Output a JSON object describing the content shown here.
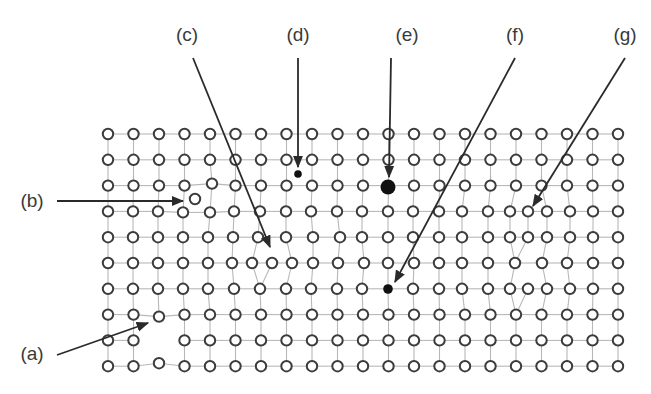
{
  "figure": {
    "colors": {
      "atom_stroke": "#3c3c3c",
      "bond": "#b8b8b8",
      "arrow": "#2a2a2a",
      "dark_atom": "#111111",
      "label": "#3a3a3a"
    }
  },
  "lattice": {
    "cols": 21,
    "rows": 10,
    "x0": 108,
    "dx": 25.5,
    "y0": 134,
    "dy": 25.8,
    "atom_radius": 5.2,
    "overrides": [
      {
        "r": 2,
        "c": 3,
        "dx": 0,
        "dy": 0
      },
      {
        "r": 2,
        "c": 4,
        "dx": 2,
        "dy": -2
      },
      {
        "r": 3,
        "c": 3,
        "dx": 0,
        "dy": 1
      },
      {
        "r": 3,
        "c": 4,
        "dx": 2,
        "dy": 1
      },
      {
        "r": 7,
        "c": 2,
        "dx": 0,
        "dy": 2
      },
      {
        "r": 9,
        "c": 2,
        "dx": 0,
        "dy": -3
      }
    ],
    "removed": [
      {
        "r": 8,
        "c": 2
      }
    ],
    "extra_atoms": [
      {
        "name": "interstitial-atom",
        "x": 195,
        "y": 199,
        "r": 5.2,
        "fill": "none"
      }
    ],
    "dislocation_rows": [
      {
        "r": 5,
        "xs": [
          108,
          133,
          158,
          183,
          208,
          232,
          252,
          272,
          292,
          313,
          338,
          364,
          388,
          414,
          439,
          462,
          488,
          515,
          542,
          567,
          593,
          618
        ]
      },
      {
        "r": 3,
        "xs": [
          108,
          133,
          158,
          183,
          208,
          234,
          260,
          286,
          311,
          337,
          362,
          388,
          413,
          439,
          462,
          488,
          510,
          528,
          547,
          570,
          593,
          618
        ]
      },
      {
        "r": 4,
        "xs": [
          108,
          133,
          158,
          183,
          208,
          233,
          258,
          286,
          313,
          340,
          362,
          388,
          413,
          439,
          462,
          488,
          510,
          528,
          547,
          570,
          593,
          618
        ]
      },
      {
        "r": 6,
        "xs": [
          108,
          133,
          158,
          183,
          208,
          234,
          260,
          286,
          311,
          337,
          362,
          388,
          413,
          439,
          462,
          488,
          510,
          528,
          547,
          570,
          593,
          618
        ]
      }
    ],
    "dark_atoms": [
      {
        "name": "small-impurity-atom",
        "x": 298,
        "y": 174,
        "r": 3.8
      },
      {
        "name": "large-substitutional-atom",
        "x": 388,
        "y": 187,
        "r": 7.5
      },
      {
        "name": "substitutional-impurity-atom",
        "x": 388,
        "y": 289,
        "r": 4.8
      }
    ]
  },
  "labels": [
    {
      "id": "a",
      "text": "(a)",
      "x": 32,
      "y": 354
    },
    {
      "id": "b",
      "text": "(b)",
      "x": 32,
      "y": 201
    },
    {
      "id": "c",
      "text": "(c)",
      "x": 187,
      "y": 35
    },
    {
      "id": "d",
      "text": "(d)",
      "x": 298,
      "y": 35
    },
    {
      "id": "e",
      "text": "(e)",
      "x": 407,
      "y": 35
    },
    {
      "id": "f",
      "text": "(f)",
      "x": 515,
      "y": 35
    },
    {
      "id": "g",
      "text": "(g)",
      "x": 625,
      "y": 35
    }
  ],
  "arrows": [
    {
      "id": "a",
      "x1": 57,
      "y1": 355,
      "x2": 148,
      "y2": 323
    },
    {
      "id": "b",
      "x1": 57,
      "y1": 201,
      "x2": 183,
      "y2": 201
    },
    {
      "id": "c",
      "x1": 193,
      "y1": 58,
      "x2": 270,
      "y2": 247
    },
    {
      "id": "d",
      "x1": 298,
      "y1": 58,
      "x2": 298,
      "y2": 167
    },
    {
      "id": "e",
      "x1": 391,
      "y1": 58,
      "x2": 389,
      "y2": 177
    },
    {
      "id": "f",
      "x1": 515,
      "y1": 58,
      "x2": 395,
      "y2": 282
    },
    {
      "id": "g",
      "x1": 625,
      "y1": 58,
      "x2": 533,
      "y2": 206
    }
  ]
}
